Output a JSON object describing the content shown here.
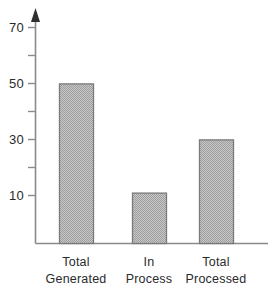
{
  "chart_data": {
    "type": "bar",
    "title": "",
    "subtitle": "",
    "xlabel": "",
    "ylabel": "",
    "categories": [
      "Total Generated",
      "In Process",
      "Total Processed"
    ],
    "category_lines": [
      [
        "Total",
        "Generated"
      ],
      [
        "In",
        "Process"
      ],
      [
        "Total",
        "Processed"
      ]
    ],
    "values": [
      57,
      18,
      37
    ],
    "ylim": [
      0,
      74
    ],
    "yticks_labeled": [
      10,
      30,
      50,
      70
    ],
    "yticks_unlabeled": [
      20,
      40,
      60
    ],
    "ytick_labels": [
      "10",
      "30",
      "50",
      "70"
    ],
    "grid": false,
    "legend": null,
    "axis_arrow": true,
    "bar_fill": "#a6a6a6",
    "bar_border": "#6e6e6e",
    "axis_color": "#8a8a8a",
    "text_color": "#2a2a2a",
    "background": "#ffffff"
  },
  "axis": {
    "tick_70": "70",
    "tick_50": "50",
    "tick_30": "30",
    "tick_10": "10"
  },
  "bars": [
    {
      "label_line1": "Total",
      "label_line2": "Generated",
      "value": 57
    },
    {
      "label_line1": "In",
      "label_line2": "Process",
      "value": 18
    },
    {
      "label_line1": "Total",
      "label_line2": "Processed",
      "value": 37
    }
  ]
}
